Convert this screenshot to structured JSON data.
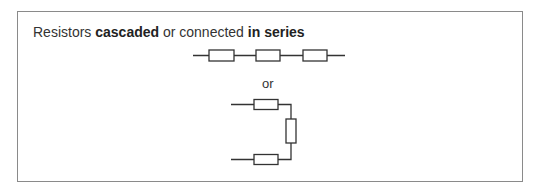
{
  "heading": {
    "part1": "Resistors ",
    "bold1": "cascaded",
    "part2": " or connected ",
    "bold2": "in series"
  },
  "separator": "or",
  "diagram": {
    "series_resistor_count": 3,
    "folded_resistor_count": 3,
    "line_color": "#333333"
  }
}
